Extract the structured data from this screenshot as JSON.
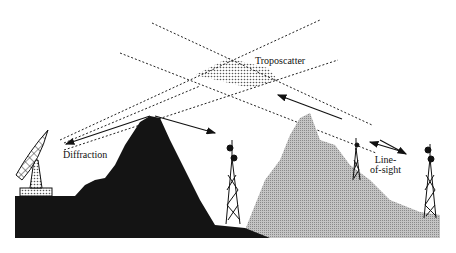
{
  "diagram": {
    "labels": {
      "troposcatter": "Troposcatter",
      "diffraction": "Diffraction",
      "line_of_sight_1": "Line-",
      "line_of_sight_2": "of-sight"
    },
    "colors": {
      "dark_mountain": "#141414",
      "light_mountain": "#b8b8b8",
      "lines": "#222222",
      "background": "#ffffff"
    },
    "icons": [
      "satellite-dish-icon",
      "radio-tower-icon",
      "radio-tower-icon",
      "radio-tower-icon"
    ]
  }
}
